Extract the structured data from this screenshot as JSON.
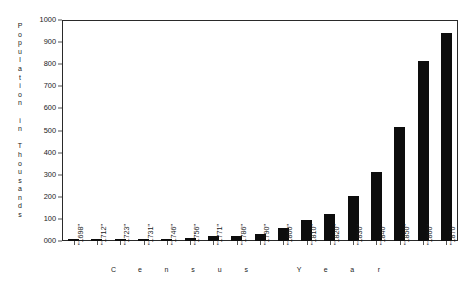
{
  "chart_data": {
    "type": "bar",
    "title": "",
    "xlabel": "Census Year",
    "ylabel": "Population in Thousands",
    "categories": [
      "1698",
      "1712",
      "1723",
      "1731",
      "1746",
      "1756",
      "1771",
      "1786",
      "1790",
      "1800",
      "1810",
      "1820",
      "1830",
      "1840",
      "1850",
      "1860",
      "1870"
    ],
    "values": [
      5,
      6,
      7,
      9,
      11,
      13,
      21,
      23,
      33,
      60,
      96,
      124,
      202,
      313,
      516,
      814,
      942
    ],
    "ylim": [
      0,
      1000
    ],
    "ytick_labels": [
      "000",
      "100",
      "200",
      "300",
      "400",
      "500",
      "600",
      "700",
      "800",
      "900",
      "1000"
    ],
    "ytick_values": [
      0,
      100,
      200,
      300,
      400,
      500,
      600,
      700,
      800,
      900,
      1000
    ],
    "grid": false,
    "legend": "none",
    "bar_color": "#0d0d0d"
  },
  "axes": {
    "y_title_letters": [
      "P",
      "o",
      "p",
      "u",
      "l",
      "a",
      "t",
      "i",
      "o",
      "n",
      "",
      "i",
      "n",
      "",
      "T",
      "h",
      "o",
      "u",
      "s",
      "a",
      "n",
      "d",
      "s"
    ],
    "x_title_letters": [
      "C",
      "e",
      "n",
      "s",
      "u",
      "s",
      "",
      "Y",
      "e",
      "a",
      "r"
    ]
  }
}
